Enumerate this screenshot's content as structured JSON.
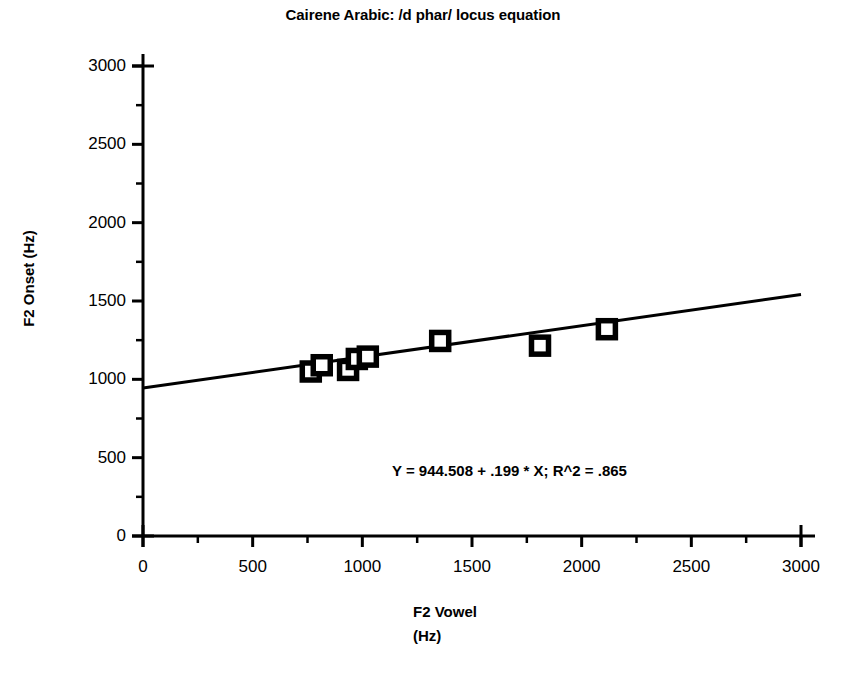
{
  "figure": {
    "title": "Cairene Arabic: /d phar/ locus equation",
    "xlabel_line1": "F2 Vowel",
    "xlabel_line2": "(Hz)",
    "ylabel": "F2 Onset (Hz)",
    "annotation": "Y = 944.508 + .199 * X; R^2 = .865",
    "line_color": "#000000",
    "marker_color": "#000000",
    "axis_color": "#000000",
    "background": "#ffffff"
  },
  "chart_data": {
    "type": "scatter",
    "title": "Cairene Arabic: /d phar/ locus equation",
    "xlabel": "F2 Vowel (Hz)",
    "ylabel": "F2 Onset (Hz)",
    "xlim": [
      0,
      3000
    ],
    "ylim": [
      0,
      3000
    ],
    "xticks": [
      0,
      500,
      1000,
      1500,
      2000,
      2500,
      3000
    ],
    "yticks": [
      0,
      500,
      1000,
      1500,
      2000,
      2500,
      3000
    ],
    "xtick_labels": [
      "0",
      "500",
      "1000",
      "1500",
      "2000",
      "2500",
      "3000"
    ],
    "ytick_labels": [
      "0",
      "500",
      "1000",
      "1500",
      "2000",
      "2500",
      "3000"
    ],
    "minor_tick_interval": 250,
    "grid": false,
    "legend": null,
    "marker": "open-square",
    "points": [
      {
        "x": 765,
        "y": 1050
      },
      {
        "x": 815,
        "y": 1090
      },
      {
        "x": 935,
        "y": 1060
      },
      {
        "x": 975,
        "y": 1130
      },
      {
        "x": 1025,
        "y": 1145
      },
      {
        "x": 1355,
        "y": 1245
      },
      {
        "x": 1810,
        "y": 1215
      },
      {
        "x": 2115,
        "y": 1320
      }
    ],
    "regression": {
      "intercept": 944.508,
      "slope": 0.199,
      "r_squared": 0.865,
      "equation_text": "Y = 944.508 + .199 * X; R^2 = .865",
      "x_range": [
        0,
        3000
      ]
    }
  }
}
